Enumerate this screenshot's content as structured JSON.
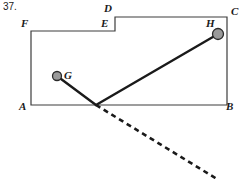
{
  "figure": {
    "problem_number": "37.",
    "width": 243,
    "height": 179,
    "background_color": "#ffffff",
    "stroke_color": "#1a1a1a",
    "outline_color": "#3c3c3c",
    "marker_fill_color": "#9a9a9a",
    "labels": {
      "A": "A",
      "B": "B",
      "C": "C",
      "D": "D",
      "E": "E",
      "F": "F",
      "G": "G",
      "H": "H"
    },
    "vertices": {
      "A": {
        "x": 31,
        "y": 105
      },
      "B": {
        "x": 227,
        "y": 105
      },
      "C": {
        "x": 227,
        "y": 17
      },
      "D": {
        "x": 115,
        "y": 17
      },
      "E": {
        "x": 115,
        "y": 31
      },
      "F": {
        "x": 31,
        "y": 31
      },
      "G": {
        "x": 57,
        "y": 76
      },
      "H": {
        "x": 218,
        "y": 34
      },
      "P": {
        "x": 96,
        "y": 105
      }
    },
    "marker_radii": {
      "G": 4.5,
      "H": 5.5
    },
    "segments": [
      {
        "name": "segment-G-P",
        "from": "G",
        "to": "P",
        "style": "solid"
      },
      {
        "name": "segment-P-H",
        "from": "P",
        "to": "H",
        "style": "solid"
      }
    ],
    "dashed_ray": {
      "name": "dashed-ray-from-P",
      "from": {
        "x": 96,
        "y": 105
      },
      "to": {
        "x": 217,
        "y": 179
      },
      "style": "dashed",
      "dash_pattern": "5 4"
    },
    "outline_path": "M 31 31 L 115 31 L 115 17 L 227 17 L 227 105 L 31 105 Z"
  }
}
